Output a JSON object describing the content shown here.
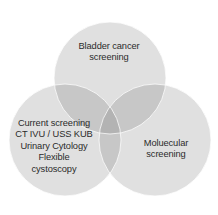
{
  "diagram": {
    "type": "venn-3-circle",
    "background_color": "#ffffff",
    "circle_fill": "#d4d4d4",
    "circle_fill_opacity": 0.72,
    "overlap_fill": "#c2c2c2",
    "text_color": "#2b2b2b",
    "circles": [
      {
        "id": "top",
        "name": "bladder-cancer-screening",
        "cx": 110,
        "cy": 78,
        "r": 56
      },
      {
        "id": "left",
        "name": "current-screening",
        "cx": 65,
        "cy": 140,
        "r": 56
      },
      {
        "id": "right",
        "name": "molecular-screening",
        "cx": 155,
        "cy": 140,
        "r": 56
      }
    ],
    "labels": {
      "top": {
        "id": "bladder-cancer-screening-label",
        "lines": [
          "Bladder cancer",
          "screening"
        ]
      },
      "left": {
        "id": "current-screening-label",
        "lines": [
          "Current screening",
          "CT IVU / USS KUB",
          "Urinary Cytology",
          "Flexible",
          "cystoscopy"
        ]
      },
      "right": {
        "id": "molecular-screening-label",
        "lines": [
          "Moluecular",
          "screening"
        ]
      }
    }
  }
}
